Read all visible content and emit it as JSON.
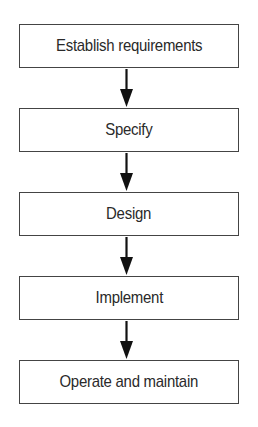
{
  "diagram": {
    "type": "flowchart",
    "direction": "top-to-bottom",
    "steps": [
      {
        "label": "Establish requirements"
      },
      {
        "label": "Specify"
      },
      {
        "label": "Design"
      },
      {
        "label": "Implement"
      },
      {
        "label": "Operate and maintain"
      }
    ],
    "connectors": [
      {
        "from": "Establish requirements",
        "to": "Specify",
        "icon": "arrow-down-icon"
      },
      {
        "from": "Specify",
        "to": "Design",
        "icon": "arrow-down-icon"
      },
      {
        "from": "Design",
        "to": "Implement",
        "icon": "arrow-down-icon"
      },
      {
        "from": "Implement",
        "to": "Operate and maintain",
        "icon": "arrow-down-icon"
      }
    ],
    "colors": {
      "box_border": "#444444",
      "text": "#2a2a2a",
      "arrow": "#111111",
      "background": "#ffffff"
    }
  }
}
